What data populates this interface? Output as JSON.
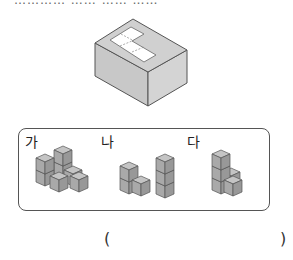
{
  "question": {
    "top_text_partial": "………… ……  ……  ……"
  },
  "figure": {
    "colors": {
      "box_face": "#cfcfcf",
      "box_edge": "#555555",
      "hole": "#ffffff",
      "cube_front": "#a9a9a9",
      "cube_side": "#9a9a9a",
      "cube_top": "#c4c4c4"
    }
  },
  "options": [
    {
      "label": "가",
      "shape": "stacked cubes: 2-high column at back, 2-high column front-left, 2 cubes extending right"
    },
    {
      "label": "나",
      "shape": "stacked cubes: 2-high left tower, 3-high right tower, connecting cube"
    },
    {
      "label": "다",
      "shape": "stacked cubes: 3-high column with 2 cubes stepping down right"
    }
  ],
  "answer": {
    "open_paren": "(",
    "close_paren": ")"
  }
}
